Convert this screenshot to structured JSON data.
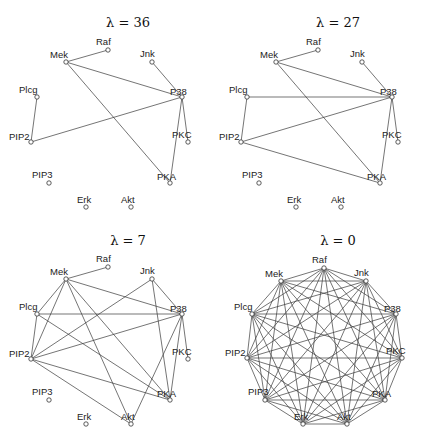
{
  "figure": {
    "panels": [
      {
        "title": "λ = 36",
        "title_pos": [
          128,
          27
        ],
        "offset": [
          0,
          0
        ],
        "layout": "inner",
        "edges": [
          [
            "Raf",
            "Mek"
          ],
          [
            "Mek",
            "P38"
          ],
          [
            "Mek",
            "PKA"
          ],
          [
            "Jnk",
            "P38"
          ],
          [
            "Plcg",
            "PIP2"
          ],
          [
            "PIP2",
            "P38"
          ],
          [
            "P38",
            "PKC"
          ],
          [
            "P38",
            "PKA"
          ]
        ]
      },
      {
        "title": "λ = 27",
        "title_pos": [
          338,
          27
        ],
        "offset": [
          210,
          0
        ],
        "layout": "inner",
        "edges": [
          [
            "Raf",
            "Mek"
          ],
          [
            "Mek",
            "P38"
          ],
          [
            "Mek",
            "PKA"
          ],
          [
            "Jnk",
            "P38"
          ],
          [
            "Plcg",
            "P38"
          ],
          [
            "Plcg",
            "PIP2"
          ],
          [
            "PIP2",
            "P38"
          ],
          [
            "PIP2",
            "PKA"
          ],
          [
            "P38",
            "PKC"
          ],
          [
            "P38",
            "PKA"
          ]
        ]
      },
      {
        "title": "λ = 7",
        "title_pos": [
          128,
          245
        ],
        "offset": [
          0,
          217
        ],
        "layout": "inner",
        "edges": [
          [
            "Raf",
            "Mek"
          ],
          [
            "Mek",
            "Plcg"
          ],
          [
            "Mek",
            "PIP2"
          ],
          [
            "Mek",
            "P38"
          ],
          [
            "Mek",
            "PKA"
          ],
          [
            "Mek",
            "Akt"
          ],
          [
            "Plcg",
            "PIP2"
          ],
          [
            "Plcg",
            "P38"
          ],
          [
            "Plcg",
            "PKA"
          ],
          [
            "Jnk",
            "PIP2"
          ],
          [
            "Jnk",
            "P38"
          ],
          [
            "Jnk",
            "PKA"
          ],
          [
            "PIP2",
            "P38"
          ],
          [
            "PIP2",
            "PKA"
          ],
          [
            "PIP2",
            "Akt"
          ],
          [
            "P38",
            "PKC"
          ],
          [
            "P38",
            "PKA"
          ],
          [
            "P38",
            "Akt"
          ]
        ]
      },
      {
        "title": "λ = 0",
        "title_pos": [
          338,
          245
        ],
        "offset": [
          0,
          0
        ],
        "layout": "complete",
        "edges": "all"
      }
    ],
    "nodes": [
      "Raf",
      "Mek",
      "Jnk",
      "Plcg",
      "P38",
      "PIP2",
      "PKC",
      "PIP3",
      "PKA",
      "Erk",
      "Akt"
    ],
    "inner_positions": {
      "Raf": [
        108,
        50
      ],
      "Mek": [
        66,
        62
      ],
      "Jnk": [
        152,
        62
      ],
      "Plcg": [
        37,
        97
      ],
      "P38": [
        182,
        97
      ],
      "PIP2": [
        31,
        142
      ],
      "PKC": [
        188,
        142
      ],
      "PIP3": [
        49,
        183
      ],
      "PKA": [
        170,
        183
      ],
      "Erk": [
        86,
        207
      ],
      "Akt": [
        131,
        207
      ]
    },
    "complete_positions": {
      "Raf": [
        324,
        268
      ],
      "Mek": [
        281,
        281
      ],
      "Jnk": [
        366,
        281
      ],
      "Plcg": [
        252,
        314
      ],
      "P38": [
        396,
        314
      ],
      "PIP2": [
        247,
        358
      ],
      "PKC": [
        402,
        358
      ],
      "PIP3": [
        265,
        400
      ],
      "PKA": [
        385,
        400
      ],
      "Erk": [
        303,
        424
      ],
      "Akt": [
        347,
        424
      ]
    },
    "label_offsets": {
      "Raf": [
        -12,
        -5
      ],
      "Mek": [
        -16,
        -4
      ],
      "Jnk": [
        -12,
        -5
      ],
      "Plcg": [
        -18,
        -4
      ],
      "P38": [
        -12,
        -2
      ],
      "PIP2": [
        -22,
        -2
      ],
      "PKC": [
        -16,
        -4
      ],
      "PIP3": [
        -17,
        -5
      ],
      "PKA": [
        -13,
        -3
      ],
      "Erk": [
        -9,
        -4
      ],
      "Akt": [
        -10,
        -4
      ]
    }
  }
}
